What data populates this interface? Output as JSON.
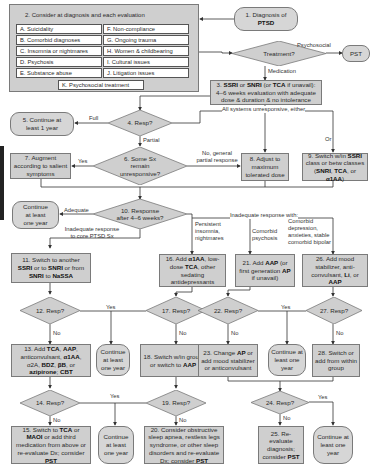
{
  "panel": {
    "title": "2. Consider at diagnosis and each evaluation",
    "items_left": [
      "A. Suicidality",
      "B. Comorbid diagnoses",
      "C. Insomnia or nightmares",
      "D. Psychosis",
      "E. Substance abuse"
    ],
    "items_right": [
      "F. Non-compliance",
      "G. Ongoing trauma",
      "H. Women & childbearing",
      "I. Cultural issues",
      "J. Litigation issues"
    ],
    "item_bottom": "K. Psychosocial treatment"
  },
  "nodes": {
    "n1": {
      "pre": "1. Diagnosis of",
      "bold": "PTSD"
    },
    "treatment": "Treatment?",
    "pst": "PST",
    "n3": {
      "l1_a": "3. ",
      "l1_b": "SSRI",
      "l1_c": " or ",
      "l1_d": "SNRI",
      "l1_e": " (or ",
      "l1_f": "TCA",
      "l1_g": " if unavail):",
      "l2": "4–6 weeks evaluation with adequate",
      "l3": "dose & duration & no intolerance"
    },
    "n4": "4. Resp?",
    "n5": "5. Continue at least 1 year",
    "n6": "6. Some Sx remain unresponsive?",
    "n7": "7. Augment according to salient symptoms",
    "n8": "8. Adjust to maximum tolerated dose",
    "n9": {
      "a": "9. Switch w/in ",
      "b": "SSRI",
      "c": " class or betw classes (",
      "d": "SNRI",
      "e": ", ",
      "f": "TCA",
      "g": ", or ",
      "h": "α1AA",
      "i": ")"
    },
    "n10": "10. Response after 4–6 weeks?",
    "cont_10": "Continue at least one year",
    "n11": {
      "a": "11. Switch to another ",
      "b": "SSRI",
      "c": " or to ",
      "d": "SNRI",
      "e": " or from ",
      "f": "SNRI",
      "g": " to ",
      "h": "NaSSA"
    },
    "n12": "12. Resp?",
    "n13": {
      "a": "13. Add ",
      "b": "TCA",
      "c": ", ",
      "d": "AAP",
      "e": ", anticonvulsant, ",
      "f": "α1AA",
      "g": ", α2A, ",
      "h": "BDZ",
      "i": ", ",
      "j": "βB",
      "k": ", or ",
      "l": "azipirone",
      "m": "; ",
      "n": "CBT"
    },
    "cont_12": "Continue at least one year",
    "n14": "14. Resp?",
    "n15": {
      "a": "15. Switch to ",
      "b": "TCA",
      "c": " or ",
      "d": "MAOI",
      "e": " or add third medication from above or re-evaluate Dx; consider ",
      "f": "PST"
    },
    "cont_14": "Continue at least one year",
    "n16": {
      "a": "16. Add ",
      "b": "α1AA",
      "c": ", low-dose ",
      "d": "TCA",
      "e": ", other sedating antidepressants"
    },
    "n17": "17. Resp?",
    "n18": {
      "a": "18. Switch w/in group or switch to ",
      "b": "AAP"
    },
    "n19": "19. Resp?",
    "n20": {
      "a": "20. Consider obstructive sleep apnea, restless legs syndrome, or other sleep disorders and re-evaluate Dx; consider ",
      "b": "PST"
    },
    "n21": {
      "a": "21. Add ",
      "b": "AAP",
      "c": " (or first generation ",
      "d": "AP",
      "e": " if unavail)"
    },
    "n22": "22. Resp?",
    "n23": {
      "a": "23. Change ",
      "b": "AP",
      "c": " or add mood stabilizer or anticonvulsant"
    },
    "cont_22": "Continue at least one year",
    "n24": "24. Resp?",
    "n25": {
      "a": "25. Re-evaluate diagnosis; consider ",
      "b": "PST"
    },
    "cont_24": "Continue at least one year",
    "n26": {
      "a": "26. Add mood stabilizer, anti-convulsant, ",
      "b": "Li",
      "c": ", or ",
      "d": "AAP"
    },
    "n27": "27. Resp?",
    "n28": "28. Switch or add from within group"
  },
  "edge_labels": {
    "psychosocial": "Psychosocial",
    "medication": "Medication",
    "all_unresponsive": "All systems unresponsive, either",
    "or": "Or",
    "full": "Full",
    "partial": "Partial",
    "yes_6": "Yes",
    "no_general": "No, general partial response",
    "adequate": "Adequate",
    "inadequate_core": "Inadequate response to core PTSD Sx",
    "inadequate_with": "Inadequate response with:",
    "persistent_insomnia": "Persistent insomnia, nightmares",
    "comorbid_psychosis": "Comorbid psychosis",
    "comorbid_depression": "Comorbid depression, anxieties, stable comorbid bipolar",
    "yes_12_17": "Yes",
    "no_12": "No",
    "no_17": "No",
    "yes_22_27": "Yes",
    "no_22": "No",
    "no_27": "No",
    "yes_14_19": "Yes",
    "no_14": "No",
    "no_19": "No",
    "yes_24": "Yes",
    "no_24": "No"
  },
  "colors": {
    "box_fill": "#cfcfcf",
    "border": "#7a7a7a",
    "line": "#333333",
    "background": "#ffffff",
    "side_tab": "#222222"
  }
}
